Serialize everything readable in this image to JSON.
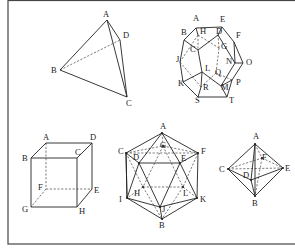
{
  "figure": {
    "solids": [
      {
        "name": "tetrahedron",
        "vertices": {
          "A": [
            107,
            20
          ],
          "B": [
            60,
            70
          ],
          "C": [
            127,
            97
          ],
          "D": [
            120,
            40
          ]
        },
        "labels": {
          "A": [
            103,
            17
          ],
          "B": [
            51,
            73
          ],
          "C": [
            126,
            106
          ],
          "D": [
            123,
            38
          ]
        },
        "edges": [
          [
            "A",
            "B"
          ],
          [
            "B",
            "C"
          ],
          [
            "A",
            "C"
          ],
          [
            "A",
            "D"
          ],
          [
            "D",
            "C"
          ]
        ],
        "hidden_edges": [
          [
            "B",
            "D"
          ]
        ]
      },
      {
        "name": "dodecahedron",
        "vertices": {
          "A": [
            196,
            28
          ],
          "E": [
            222,
            27
          ],
          "B": [
            184,
            40
          ],
          "F": [
            234,
            42
          ],
          "H": [
            198,
            35
          ],
          "D": [
            218,
            35
          ],
          "C": [
            198,
            50
          ],
          "G": [
            219,
            48
          ],
          "J": [
            180,
            62
          ],
          "N": [
            235,
            63
          ],
          "O": [
            243,
            63
          ],
          "L": [
            202,
            72
          ],
          "Q": [
            216,
            73
          ],
          "K": [
            183,
            82
          ],
          "P": [
            232,
            80
          ],
          "R": [
            201,
            87
          ],
          "M": [
            221,
            86
          ],
          "S": [
            198,
            97
          ],
          "T": [
            227,
            97
          ]
        },
        "labels": {
          "A": [
            193,
            21
          ],
          "E": [
            220,
            22
          ],
          "B": [
            181,
            35
          ],
          "F": [
            236,
            38
          ],
          "H": [
            200,
            34
          ],
          "D": [
            216,
            34
          ],
          "C": [
            190,
            52
          ],
          "G": [
            221,
            49
          ],
          "J": [
            176,
            62
          ],
          "N": [
            226,
            64
          ],
          "O": [
            246,
            65
          ],
          "L": [
            205,
            71
          ],
          "Q": [
            215,
            75
          ],
          "K": [
            178,
            86
          ],
          "P": [
            236,
            85
          ],
          "R": [
            203,
            90
          ],
          "M": [
            221,
            90
          ],
          "S": [
            195,
            103
          ],
          "T": [
            229,
            103
          ]
        },
        "edges": [
          [
            "A",
            "E"
          ],
          [
            "A",
            "B"
          ],
          [
            "E",
            "F"
          ],
          [
            "B",
            "J"
          ],
          [
            "F",
            "O"
          ],
          [
            "J",
            "K"
          ],
          [
            "O",
            "P"
          ],
          [
            "K",
            "S"
          ],
          [
            "P",
            "T"
          ],
          [
            "S",
            "T"
          ],
          [
            "B",
            "C"
          ],
          [
            "A",
            "H"
          ],
          [
            "E",
            "D"
          ],
          [
            "F",
            "N"
          ],
          [
            "D",
            "C"
          ],
          [
            "D",
            "N"
          ],
          [
            "C",
            "L"
          ],
          [
            "N",
            "O"
          ],
          [
            "N",
            "M"
          ],
          [
            "L",
            "K"
          ],
          [
            "L",
            "M"
          ],
          [
            "M",
            "T"
          ],
          [
            "L",
            "R"
          ],
          [
            "R",
            "S"
          ],
          [
            "M",
            "P"
          ]
        ],
        "hidden_edges": [
          [
            "H",
            "C"
          ],
          [
            "H",
            "G"
          ],
          [
            "G",
            "D"
          ],
          [
            "G",
            "Q"
          ],
          [
            "Q",
            "P"
          ],
          [
            "Q",
            "R"
          ],
          [
            "J",
            "R"
          ],
          [
            "H",
            "J"
          ]
        ]
      },
      {
        "name": "cube",
        "vertices": {
          "A": [
            46,
            143
          ],
          "D": [
            92,
            143
          ],
          "B": [
            31,
            158
          ],
          "C": [
            77,
            158
          ],
          "F": [
            46,
            189
          ],
          "E": [
            92,
            189
          ],
          "G": [
            31,
            207
          ],
          "H": [
            77,
            207
          ]
        },
        "labels": {
          "A": [
            43,
            140
          ],
          "D": [
            90,
            140
          ],
          "B": [
            22,
            161
          ],
          "C": [
            75,
            155
          ],
          "F": [
            38,
            190
          ],
          "E": [
            94,
            193
          ],
          "G": [
            22,
            212
          ],
          "H": [
            79,
            214
          ]
        },
        "edges": [
          [
            "A",
            "D"
          ],
          [
            "A",
            "B"
          ],
          [
            "D",
            "C"
          ],
          [
            "B",
            "C"
          ],
          [
            "D",
            "E"
          ],
          [
            "B",
            "G"
          ],
          [
            "C",
            "H"
          ],
          [
            "G",
            "H"
          ],
          [
            "H",
            "E"
          ]
        ],
        "hidden_edges": [
          [
            "A",
            "F"
          ],
          [
            "F",
            "E"
          ],
          [
            "F",
            "G"
          ]
        ]
      },
      {
        "name": "icosahedron",
        "vertices": {
          "A": [
            162,
            133
          ],
          "C": [
            126,
            153
          ],
          "F": [
            198,
            153
          ],
          "G": [
            163,
            146
          ],
          "D": [
            139,
            163
          ],
          "E": [
            180,
            163
          ],
          "H": [
            143,
            187
          ],
          "L": [
            183,
            187
          ],
          "I": [
            127,
            198
          ],
          "K": [
            197,
            198
          ],
          "J": [
            160,
            207
          ],
          "B": [
            162,
            219
          ]
        },
        "labels": {
          "A": [
            160,
            129
          ],
          "C": [
            118,
            154
          ],
          "F": [
            201,
            154
          ],
          "G": [
            160,
            148
          ],
          "D": [
            133,
            160
          ],
          "E": [
            181,
            161
          ],
          "H": [
            134,
            196
          ],
          "L": [
            183,
            196
          ],
          "I": [
            119,
            202
          ],
          "K": [
            200,
            202
          ],
          "J": [
            162,
            212
          ],
          "B": [
            159,
            228
          ]
        },
        "edges": [
          [
            "A",
            "C"
          ],
          [
            "A",
            "F"
          ],
          [
            "A",
            "D"
          ],
          [
            "A",
            "E"
          ],
          [
            "C",
            "D"
          ],
          [
            "D",
            "E"
          ],
          [
            "E",
            "F"
          ],
          [
            "C",
            "I"
          ],
          [
            "F",
            "K"
          ],
          [
            "I",
            "J"
          ],
          [
            "J",
            "K"
          ],
          [
            "I",
            "B"
          ],
          [
            "K",
            "B"
          ],
          [
            "J",
            "B"
          ],
          [
            "D",
            "I"
          ],
          [
            "D",
            "J"
          ],
          [
            "E",
            "J"
          ],
          [
            "E",
            "K"
          ],
          [
            "C",
            "I"
          ]
        ],
        "hidden_edges": [
          [
            "A",
            "G"
          ],
          [
            "C",
            "G"
          ],
          [
            "G",
            "F"
          ],
          [
            "C",
            "H"
          ],
          [
            "G",
            "H"
          ],
          [
            "G",
            "L"
          ],
          [
            "F",
            "L"
          ],
          [
            "H",
            "L"
          ],
          [
            "H",
            "I"
          ],
          [
            "H",
            "B"
          ],
          [
            "L",
            "K"
          ],
          [
            "L",
            "B"
          ],
          [
            "C",
            "F"
          ]
        ]
      },
      {
        "name": "octahedron",
        "vertices": {
          "A": [
            255,
            144
          ],
          "F": [
            262,
            158
          ],
          "C": [
            228,
            169
          ],
          "E": [
            283,
            168
          ],
          "D": [
            251,
            180
          ],
          "B": [
            255,
            196
          ]
        },
        "labels": {
          "A": [
            253,
            139
          ],
          "F": [
            262,
            160
          ],
          "C": [
            219,
            172
          ],
          "E": [
            285,
            171
          ],
          "D": [
            243,
            178
          ],
          "B": [
            252,
            206
          ]
        },
        "edges": [
          [
            "A",
            "C"
          ],
          [
            "A",
            "E"
          ],
          [
            "C",
            "B"
          ],
          [
            "E",
            "B"
          ],
          [
            "A",
            "D"
          ],
          [
            "D",
            "B"
          ],
          [
            "C",
            "D"
          ],
          [
            "D",
            "E"
          ],
          [
            "A",
            "B"
          ]
        ],
        "hidden_edges": [
          [
            "C",
            "F"
          ],
          [
            "F",
            "E"
          ],
          [
            "A",
            "F"
          ],
          [
            "F",
            "B"
          ],
          [
            "C",
            "E"
          ]
        ]
      }
    ]
  }
}
